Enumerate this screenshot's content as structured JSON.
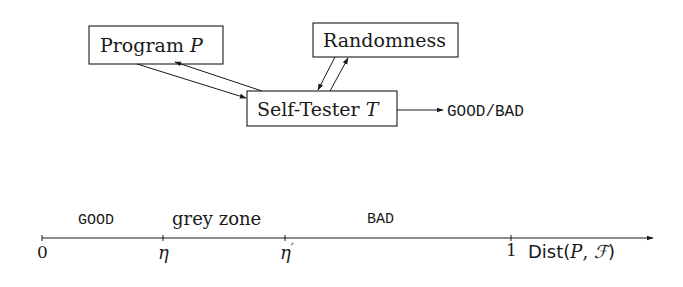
{
  "diagram": {
    "boxes": {
      "program": {
        "label": "Program ",
        "var": "P"
      },
      "randomness": {
        "label": "Randomness"
      },
      "tester": {
        "label": "Self-Tester ",
        "var": "T"
      }
    },
    "output": {
      "label": "GOOD/BAD"
    },
    "edges": [
      {
        "from": "program",
        "to": "tester"
      },
      {
        "from": "tester",
        "to": "program"
      },
      {
        "from": "randomness",
        "to": "tester"
      },
      {
        "from": "tester",
        "to": "randomness"
      },
      {
        "from": "tester",
        "to": "output"
      }
    ]
  },
  "axis": {
    "regions": {
      "good": "GOOD",
      "grey": "grey zone",
      "bad": "BAD"
    },
    "ticks": {
      "zero": "0",
      "eta": "η",
      "eta_prime": "η",
      "eta_prime_mark": "′",
      "one": "1"
    },
    "label": {
      "prefix": "Dist(",
      "p": "P",
      "comma": ", ",
      "f": "ℱ",
      "suffix": ")"
    }
  }
}
